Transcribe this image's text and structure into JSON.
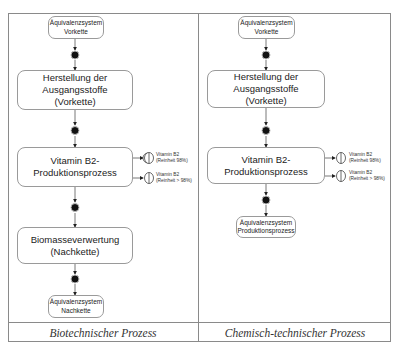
{
  "columns": [
    {
      "footer": "Biotechnischer Prozess",
      "nodes": {
        "start": {
          "line1": "Äquivalenzsystem",
          "line2": "Vorkette"
        },
        "step1": {
          "line1": "Herstellung der Ausgangsstoffe",
          "line2": "(Vorkette)"
        },
        "step2": {
          "line1": "Vitamin B2-",
          "line2": "Produktionsprozess"
        },
        "step3": {
          "line1": "Biomasseverwertung",
          "line2": "(Nachkette)"
        },
        "end": {
          "line1": "Äquivalenzsystem",
          "line2": "Nachkette"
        }
      },
      "outputs": [
        {
          "line1": "Vitamin B2",
          "line2": "(Reinheit 98%)"
        },
        {
          "line1": "Vitamin B2",
          "line2": "(Reinheit > 98%)"
        }
      ]
    },
    {
      "footer": "Chemisch-technischer Prozess",
      "nodes": {
        "start": {
          "line1": "Äquivalenzsystem",
          "line2": "Vorkette"
        },
        "step1": {
          "line1": "Herstellung der Ausgangsstoffe",
          "line2": "(Vorkette)"
        },
        "step2": {
          "line1": "Vitamin B2-",
          "line2": "Produktionsprozess"
        },
        "end": {
          "line1": "Äquivalenzsystem",
          "line2": "Produktionsprozess"
        }
      },
      "outputs": [
        {
          "line1": "Vitamin B2",
          "line2": "(Reinheit 98%)"
        },
        {
          "line1": "Vitamin B2",
          "line2": "(Reinheit > 98%)"
        }
      ]
    }
  ],
  "colors": {
    "line": "#8a8a8a",
    "node": "#111111",
    "box_border": "#9a9a9a"
  }
}
